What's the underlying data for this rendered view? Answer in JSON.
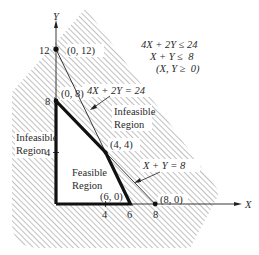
{
  "diagram": {
    "type": "linear-programming-feasible-region",
    "axes": {
      "x_label": "X",
      "y_label": "Y",
      "x_ticks": [
        "4",
        "6",
        "8"
      ],
      "y_ticks": [
        "4",
        "8",
        "12"
      ]
    },
    "constraints_box": {
      "line1": "4X + 2Y ≤ 24",
      "line2": "X + Y ≤  8",
      "line3": "(X, Y ≥  0)"
    },
    "lines": [
      {
        "label": "4X + 2Y = 24",
        "from": [
          0,
          12
        ],
        "to": [
          6,
          0
        ]
      },
      {
        "label": "X + Y = 8",
        "from": [
          0,
          8
        ],
        "to": [
          8,
          0
        ]
      }
    ],
    "points": [
      {
        "label": "(0, 12)",
        "x": 0,
        "y": 12
      },
      {
        "label": "(0, 8)",
        "x": 0,
        "y": 8
      },
      {
        "label": "(4, 4)",
        "x": 4,
        "y": 4
      },
      {
        "label": "(6, 0)",
        "x": 6,
        "y": 0
      },
      {
        "label": "(8, 0)",
        "x": 8,
        "y": 0
      }
    ],
    "regions": {
      "feasible_line1": "Feasible",
      "feasible_line2": "Region",
      "infeasible_left_line1": "Infeasible",
      "infeasible_left_line2": "Region",
      "infeasible_right_line1": "Infeasible",
      "infeasible_right_line2": "Region"
    },
    "feasible_polygon": [
      [
        0,
        0
      ],
      [
        0,
        8
      ],
      [
        4,
        4
      ],
      [
        6,
        0
      ]
    ],
    "colors": {
      "ink": "#1a1a1a",
      "hatch": "#9a9a9a",
      "background": "#ffffff"
    }
  }
}
